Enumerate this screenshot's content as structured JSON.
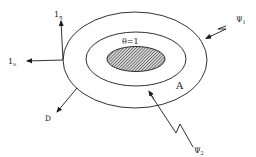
{
  "diagram": {
    "type": "nested-ellipses-with-vectors",
    "colors": {
      "stroke": "#1a1a1a",
      "background": "#ffffff",
      "hatch": "#333333"
    },
    "regions": {
      "inner": {
        "label": "θ=1",
        "fill": "hatched"
      },
      "annulus": {
        "label": "A"
      }
    },
    "vectors": {
      "normal": {
        "label": "1",
        "subscript": "η"
      },
      "tangent": {
        "label": "1",
        "subscript": "ν"
      },
      "flux": {
        "label": "D"
      }
    },
    "incoming_rays": {
      "psi1": {
        "label": "Ψ",
        "subscript": "1"
      },
      "psi2": {
        "label": "Ψ",
        "subscript": "2"
      }
    }
  }
}
